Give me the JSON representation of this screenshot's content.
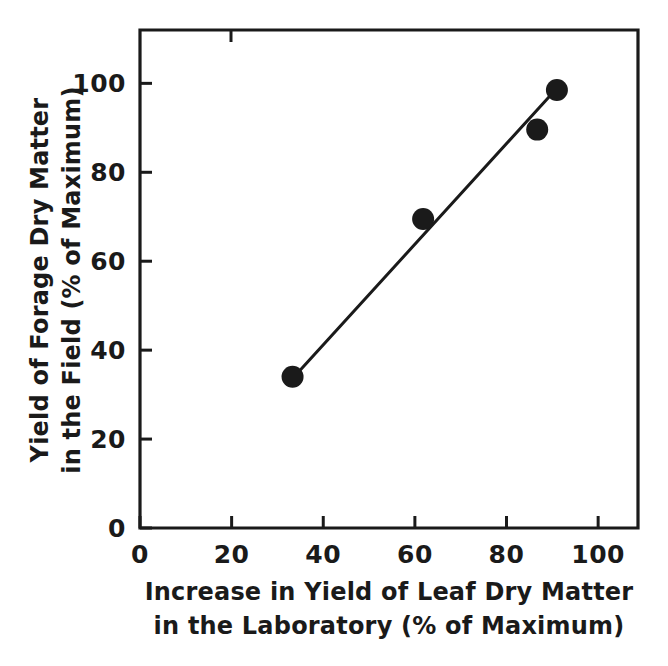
{
  "chart_data": {
    "type": "scatter",
    "title": "",
    "subtitle": "",
    "xlabel_line1": "Increase in Yield of Leaf Dry Matter",
    "xlabel_line2": "in the Laboratory (% of Maximum)",
    "ylabel_line1": "Yield of Forage Dry Matter",
    "ylabel_line2": "in the Field (% of Maximum)",
    "xlim": [
      0,
      108.7
    ],
    "ylim": [
      0,
      112
    ],
    "xticks": [
      0,
      20,
      40,
      60,
      80,
      100
    ],
    "yticks": [
      0,
      20,
      40,
      60,
      80,
      100
    ],
    "xtick_labels": [
      "0",
      "20",
      "40",
      "60",
      "80",
      "100"
    ],
    "ytick_labels": [
      "0",
      "20",
      "40",
      "60",
      "80",
      "100"
    ],
    "grid": false,
    "legend": null,
    "marker_style": "filled-circle",
    "marker_color": "#1a1a1a",
    "marker_radius_px": 11,
    "points": [
      {
        "x": 33.3,
        "y": 34.0
      },
      {
        "x": 61.8,
        "y": 69.5
      },
      {
        "x": 86.7,
        "y": 89.6
      },
      {
        "x": 91.0,
        "y": 98.5
      }
    ],
    "series": [
      {
        "name": "Field vs laboratory yield",
        "x": [
          33.3,
          61.8,
          86.7,
          91.0
        ],
        "values": [
          34.0,
          69.5,
          89.6,
          98.5
        ]
      }
    ],
    "fit_line": {
      "type": "linear",
      "color": "#1a1a1a",
      "x_start": 33.3,
      "y_start": 33.6,
      "x_end": 91.0,
      "y_end": 98.9
    },
    "annotations": []
  },
  "colors": {
    "ink": "#1a1a1a",
    "background": "#ffffff"
  }
}
